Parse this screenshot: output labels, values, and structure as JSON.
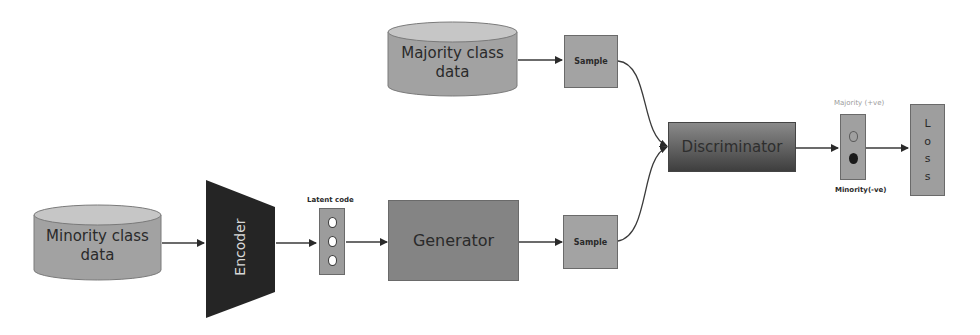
{
  "diagram": {
    "nodes": {
      "majority_data": {
        "line1": "Majority class",
        "line2": "data"
      },
      "minority_data": {
        "line1": "Minority class",
        "line2": "data"
      },
      "sample_top": {
        "label": "Sample"
      },
      "sample_bottom": {
        "label": "Sample"
      },
      "encoder": {
        "label": "Encoder"
      },
      "latent_code": {
        "label": "Latent code",
        "units": 3
      },
      "generator": {
        "label": "Generator"
      },
      "discriminator": {
        "label": "Discriminator"
      },
      "output": {
        "majority_label": "Majority (+ve)",
        "minority_label": "Minority(-ve)"
      },
      "loss": {
        "letters": [
          "L",
          "o",
          "s",
          "s"
        ]
      }
    },
    "edges": [
      {
        "from": "majority_data",
        "to": "sample_top"
      },
      {
        "from": "sample_top",
        "to": "discriminator"
      },
      {
        "from": "minority_data",
        "to": "encoder"
      },
      {
        "from": "encoder",
        "to": "latent_code"
      },
      {
        "from": "latent_code",
        "to": "generator"
      },
      {
        "from": "generator",
        "to": "sample_bottom"
      },
      {
        "from": "sample_bottom",
        "to": "discriminator"
      },
      {
        "from": "discriminator",
        "to": "output"
      },
      {
        "from": "output",
        "to": "loss"
      }
    ],
    "colors": {
      "cylinder_body": "#a2a2a2",
      "cylinder_top": "#c6c6c6",
      "encoder": "#252525",
      "generator": "#848484",
      "sample": "#a3a3a3",
      "arrow": "#3a3a3a"
    }
  }
}
